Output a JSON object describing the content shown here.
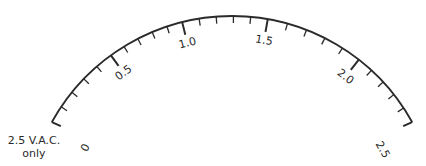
{
  "meter_scale": {
    "center": [
      232,
      222
    ],
    "radius": 206,
    "start_angle_deg": 151,
    "end_angle_deg": 29,
    "stroke_color": "#2a2a2a",
    "major_ticks": [
      {
        "label": "0",
        "angle": 151
      },
      {
        "label": "0.5",
        "angle": 126
      },
      {
        "label": "1.0",
        "angle": 104
      },
      {
        "label": "1.5",
        "angle": 80
      },
      {
        "label": "2.0",
        "angle": 52
      },
      {
        "label": "2.5",
        "angle": 29
      }
    ],
    "minor_per_major": 4
  },
  "note": {
    "line1": "2.5  V.A.C.",
    "line2": "only"
  }
}
